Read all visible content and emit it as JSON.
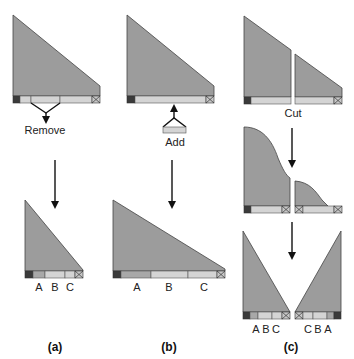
{
  "figure": {
    "panels": [
      {
        "id": "a",
        "caption": "(a)",
        "operation_label": "Remove",
        "segment_labels": [
          "A",
          "B",
          "C"
        ]
      },
      {
        "id": "b",
        "caption": "(b)",
        "operation_label": "Add",
        "segment_labels": [
          "A",
          "B",
          "C"
        ]
      },
      {
        "id": "c",
        "caption": "(c)",
        "operation_label": "Cut",
        "segment_labels_left": [
          "A",
          "B",
          "C"
        ],
        "segment_labels_right": [
          "C",
          "B",
          "A"
        ]
      }
    ]
  }
}
